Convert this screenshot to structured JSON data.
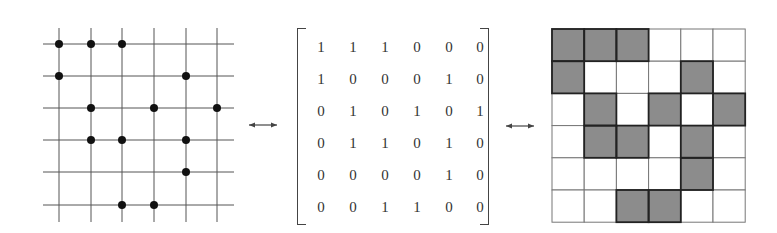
{
  "diagram": {
    "rows": 6,
    "cols": 6,
    "matrix": [
      [
        1,
        1,
        1,
        0,
        0,
        0
      ],
      [
        1,
        0,
        0,
        0,
        1,
        0
      ],
      [
        0,
        1,
        0,
        1,
        0,
        1
      ],
      [
        0,
        1,
        1,
        0,
        1,
        0
      ],
      [
        0,
        0,
        0,
        0,
        1,
        0
      ],
      [
        0,
        0,
        1,
        1,
        0,
        0
      ]
    ],
    "arrows": [
      {
        "from": "dot-lattice",
        "to": "matrix",
        "symbol": "↔"
      },
      {
        "from": "matrix",
        "to": "shaded-grid",
        "symbol": "↔"
      }
    ],
    "colors": {
      "line": "#555555",
      "dot": "#111111",
      "shade": "#8c8c8c",
      "text": "#333333"
    }
  }
}
